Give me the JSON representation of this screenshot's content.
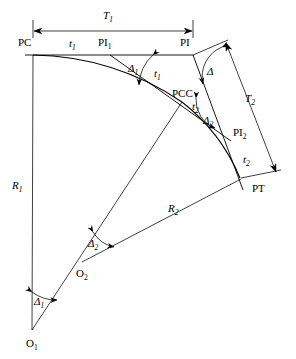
{
  "diagram": {
    "points": [
      {
        "id": "PC",
        "label": "PC",
        "x": 33,
        "y": 55,
        "label_x": 18,
        "label_y": 46
      },
      {
        "id": "PI1",
        "label": "PI",
        "sub": "1",
        "x": 110,
        "y": 55,
        "label_x": 98,
        "label_y": 46
      },
      {
        "id": "PI",
        "label": "PI",
        "x": 193,
        "y": 55,
        "label_x": 180,
        "label_y": 46
      },
      {
        "id": "PCC",
        "label": "PCC",
        "x": 182,
        "y": 102,
        "label_x": 172,
        "label_y": 97
      },
      {
        "id": "PI2",
        "label": "PI",
        "sub": "2",
        "x": 231,
        "y": 141,
        "label_x": 233,
        "label_y": 136
      },
      {
        "id": "PT",
        "label": "PT",
        "x": 240,
        "y": 178,
        "label_x": 252,
        "label_y": 192
      },
      {
        "id": "O1",
        "label": "O",
        "sub": "1",
        "x": 32,
        "y": 330,
        "label_x": 26,
        "label_y": 345
      },
      {
        "id": "O2",
        "label": "O",
        "sub": "2",
        "x": 82,
        "y": 262,
        "label_x": 78,
        "label_y": 275
      }
    ],
    "dimensions": [
      {
        "id": "T1",
        "label": "T",
        "sub": "1",
        "label_x": 108,
        "label_y": 19,
        "from_x": 33,
        "from_y": 31,
        "to_x": 193,
        "to_y": 31
      },
      {
        "id": "T2",
        "label": "T",
        "sub": "2",
        "label_x": 250,
        "label_y": 102,
        "from_x": 225,
        "from_y": 42,
        "to_x": 277,
        "to_y": 173
      }
    ],
    "tangent_labels": [
      {
        "id": "t1a",
        "label": "t",
        "sub": "1",
        "x": 73,
        "y": 45
      },
      {
        "id": "t1b",
        "label": "t",
        "sub": "1",
        "x": 158,
        "y": 73
      },
      {
        "id": "t2a",
        "label": "t",
        "sub": "2",
        "x": 195,
        "y": 108
      },
      {
        "id": "t2b",
        "label": "t",
        "sub": "2",
        "x": 246,
        "y": 160
      }
    ],
    "radius_labels": [
      {
        "id": "R1",
        "label": "R",
        "sub": "1",
        "x": 14,
        "y": 186
      },
      {
        "id": "R2",
        "label": "R",
        "sub": "2",
        "x": 172,
        "y": 209
      }
    ],
    "angle_labels": [
      {
        "id": "D1top",
        "label": "Δ",
        "sub": "1",
        "x": 133,
        "y": 68
      },
      {
        "id": "Dapex",
        "label": "Δ",
        "sub": "",
        "x": 211,
        "y": 71
      },
      {
        "id": "D2top",
        "label": "Δ",
        "sub": "2",
        "x": 208,
        "y": 120
      },
      {
        "id": "D2cent",
        "label": "Δ",
        "sub": "2",
        "x": 93,
        "y": 243
      },
      {
        "id": "D1cent",
        "label": "Δ",
        "sub": "1",
        "x": 39,
        "y": 301
      }
    ],
    "colors": {
      "line": "#000000",
      "background": "#ffffff"
    }
  }
}
